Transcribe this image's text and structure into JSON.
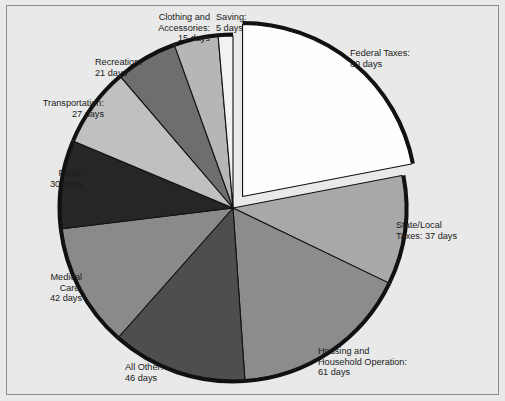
{
  "figure": {
    "background_color": "#e9e9e9",
    "border_color": "#8d8d8d",
    "rim_color": "#111111"
  },
  "chart_data": {
    "type": "pie",
    "title": "",
    "subtitle": "",
    "xlabel": "",
    "ylabel": "",
    "grid": false,
    "legend_position": "outside-labels",
    "units": "days",
    "total_days": 364,
    "start_angle_deg": -90,
    "direction": "clockwise",
    "exploded_slices": [
      "Federal Taxes"
    ],
    "categories": [
      "Federal Taxes",
      "State/Local Taxes",
      "Housing and Household Operation",
      "All Other",
      "Medical Care",
      "Food",
      "Transportation",
      "Recreation",
      "Clothing and Accessories",
      "Saving"
    ],
    "values": [
      80,
      37,
      61,
      46,
      42,
      30,
      27,
      21,
      15,
      5
    ],
    "slices": [
      {
        "name": "Federal Taxes",
        "label": "Federal Taxes:\n80 days",
        "value": 80,
        "unit": "days",
        "color": "#fefefe",
        "exploded": true
      },
      {
        "name": "State/Local Taxes",
        "label": "State/Local\nTaxes: 37 days",
        "value": 37,
        "unit": "days",
        "color": "#a8a8a8",
        "exploded": false
      },
      {
        "name": "Housing and Household Operation",
        "label": "Housing and\nHousehold Operation:\n61 days",
        "value": 61,
        "unit": "days",
        "color": "#8c8c8c",
        "exploded": false
      },
      {
        "name": "All Other",
        "label": "All Other:\n46 days",
        "value": 46,
        "unit": "days",
        "color": "#4e4e4e",
        "exploded": false
      },
      {
        "name": "Medical Care",
        "label": "Medical\nCare:\n42 days",
        "value": 42,
        "unit": "days",
        "color": "#8a8a8a",
        "exploded": false
      },
      {
        "name": "Food",
        "label": "Food:\n30 days",
        "value": 30,
        "unit": "days",
        "color": "#262626",
        "exploded": false
      },
      {
        "name": "Transportation",
        "label": "Transportation:\n27 days",
        "value": 27,
        "unit": "days",
        "color": "#c0c0c0",
        "exploded": false
      },
      {
        "name": "Recreation",
        "label": "Recreation:\n21 days",
        "value": 21,
        "unit": "days",
        "color": "#6e6e6e",
        "exploded": false
      },
      {
        "name": "Clothing and Accessories",
        "label": "Clothing and\nAccessories:\n15 days",
        "value": 15,
        "unit": "days",
        "color": "#b6b6b6",
        "exploded": false
      },
      {
        "name": "Saving",
        "label": "Saving:\n5 days",
        "value": 5,
        "unit": "days",
        "color": "#f2f2f2",
        "exploded": false
      }
    ]
  },
  "labels": {
    "federal_taxes": "Federal Taxes:\n80 days",
    "state_local_taxes": "State/Local\nTaxes: 37 days",
    "housing": "Housing and\nHousehold Operation:\n61 days",
    "all_other": "All Other:\n46 days",
    "medical_care": "Medical\nCare:\n42 days",
    "food": "Food:\n30 days",
    "transportation": "Transportation:\n27 days",
    "recreation": "Recreation:\n21 days",
    "clothing": "Clothing and\nAccessories:\n15 days",
    "saving": "Saving:\n5 days"
  }
}
